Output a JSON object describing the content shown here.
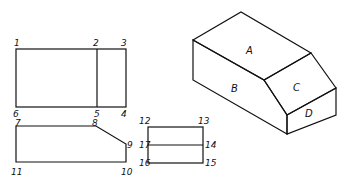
{
  "figure": {
    "front_view": {
      "point_labels": [
        "1",
        "2",
        "3",
        "4",
        "5",
        "6"
      ]
    },
    "side_view": {
      "point_labels": [
        "7",
        "8",
        "9",
        "10",
        "11"
      ]
    },
    "small_view": {
      "point_labels": [
        "12",
        "13",
        "14",
        "15",
        "16",
        "17"
      ]
    },
    "isometric": {
      "face_labels": [
        "A",
        "B",
        "C",
        "D"
      ]
    }
  }
}
